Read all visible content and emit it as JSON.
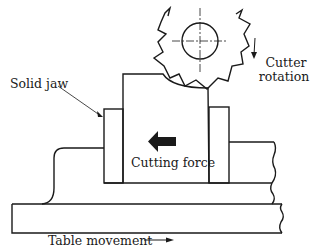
{
  "diagram": {
    "labels": {
      "solid_jaw": "Solid jaw",
      "cutter_rotation_line1": "Cutter",
      "cutter_rotation_line2": "rotation",
      "cutting_force": "Cutting force",
      "table_movement": "Table movement"
    },
    "components": [
      "milling-cutter",
      "cutter-center-mark",
      "workpiece",
      "solid-jaw",
      "movable-jaw",
      "vice-body",
      "machine-table",
      "cutting-force-arrow",
      "table-movement-arrow",
      "cutter-rotation-arrow",
      "solid-jaw-leader"
    ],
    "colors": {
      "stroke": "#1a1a1a",
      "background": "#ffffff"
    }
  }
}
